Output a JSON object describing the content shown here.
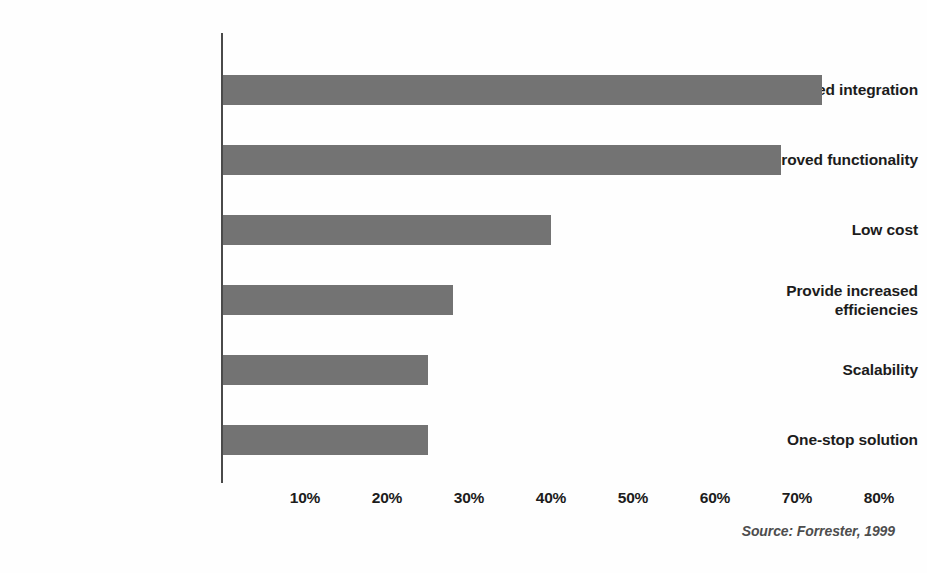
{
  "chart_data": {
    "type": "bar",
    "orientation": "horizontal",
    "title": "",
    "subtitle": "",
    "xlabel": "",
    "ylabel": "",
    "xlim": [
      0,
      80
    ],
    "ylim": null,
    "grid": false,
    "legend": null,
    "legend_position": "none",
    "bar_color": "#737373",
    "axis_color": "#4a4a4a",
    "text_color": "#1c1c1c",
    "categories": [
      "Improved integration",
      "Improved functionality",
      "Low cost",
      "Provide increased efficiencies",
      "Scalability",
      "One-stop solution"
    ],
    "values": [
      73,
      68,
      40,
      28,
      25,
      25
    ],
    "value_unit": "%",
    "xticks": [
      10,
      20,
      30,
      40,
      50,
      60,
      70,
      80
    ],
    "xticklabels": [
      "10%",
      "20%",
      "30%",
      "40%",
      "50%",
      "60%",
      "70%",
      "80%"
    ],
    "annotations": [
      "Source: Forrester, 1999"
    ]
  },
  "bars": [
    {
      "label": "Improved integration",
      "label_line1": "Improved integration",
      "label_line2": "",
      "value": 73,
      "wrapped": false
    },
    {
      "label": "Improved functionality",
      "label_line1": "Improved functionality",
      "label_line2": "",
      "value": 68,
      "wrapped": false
    },
    {
      "label": "Low cost",
      "label_line1": "Low cost",
      "label_line2": "",
      "value": 40,
      "wrapped": false
    },
    {
      "label": "Provide increased efficiencies",
      "label_line1": "Provide increased",
      "label_line2": "efficiencies",
      "value": 28,
      "wrapped": true
    },
    {
      "label": "Scalability",
      "label_line1": "Scalability",
      "label_line2": "",
      "value": 25,
      "wrapped": false
    },
    {
      "label": "One-stop solution",
      "label_line1": "One-stop solution",
      "label_line2": "",
      "value": 25,
      "wrapped": false
    }
  ],
  "axis": {
    "ticks": [
      {
        "label": "10%",
        "value": 10
      },
      {
        "label": "20%",
        "value": 20
      },
      {
        "label": "30%",
        "value": 30
      },
      {
        "label": "40%",
        "value": 40
      },
      {
        "label": "50%",
        "value": 50
      },
      {
        "label": "60%",
        "value": 60
      },
      {
        "label": "70%",
        "value": 70
      },
      {
        "label": "80%",
        "value": 80
      }
    ]
  },
  "footer": {
    "source": "Source: Forrester, 1999"
  }
}
